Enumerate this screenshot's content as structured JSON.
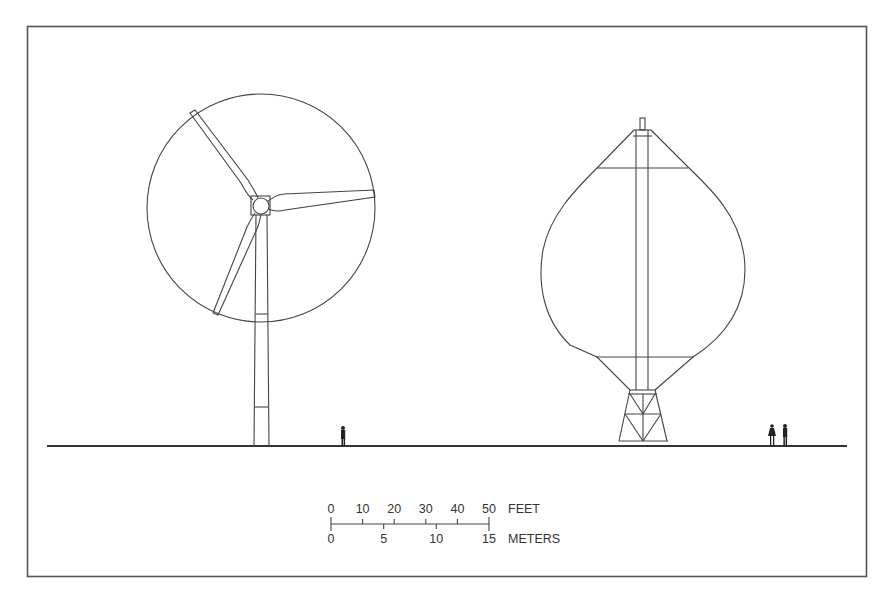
{
  "figure": {
    "turbines": [
      {
        "type": "horizontal-axis",
        "blades": 3,
        "position": "left"
      },
      {
        "type": "vertical-axis-darrieus",
        "position": "right"
      }
    ],
    "human_figures": 3
  },
  "scale_bar": {
    "feet_label": "FEET",
    "meters_label": "METERS",
    "feet_ticks": [
      "0",
      "10",
      "20",
      "30",
      "40",
      "50"
    ],
    "meter_ticks": [
      "0",
      "5",
      "10",
      "15"
    ]
  },
  "colors": {
    "line": "#444444",
    "background": "#ffffff",
    "border": "#555555"
  }
}
